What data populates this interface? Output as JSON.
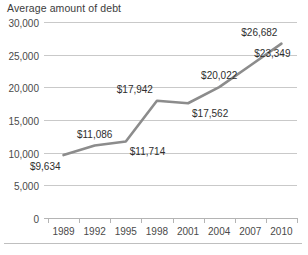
{
  "chart_data": {
    "type": "line",
    "title": "Average amount of debt",
    "xlabel": "",
    "ylabel": "",
    "categories": [
      "1989",
      "1992",
      "1995",
      "1998",
      "2001",
      "2004",
      "2007",
      "2010"
    ],
    "values": [
      9634,
      11086,
      11714,
      17942,
      17562,
      20022,
      23349,
      26682
    ],
    "point_labels": [
      "$9,634",
      "$11,086",
      "$11,714",
      "$17,942",
      "$17,562",
      "$20,022",
      "$23,349",
      "$26,682"
    ],
    "label_positions": [
      "below-left",
      "above",
      "below-right",
      "above-left",
      "below-right",
      "above",
      "above-right",
      "above-left"
    ],
    "ylim": [
      0,
      30000
    ],
    "ytick_values": [
      0,
      5000,
      10000,
      15000,
      20000,
      25000,
      30000
    ],
    "ytick_labels": [
      "0",
      "5,000",
      "10,000",
      "15,000",
      "20,000",
      "25,000",
      "30,000"
    ],
    "grid": true,
    "legend": false,
    "series_color": "#8c8c8c",
    "grid_color": "#c9c9c9",
    "axis_color": "#b4b4b4",
    "text_color": "#3c3c3c",
    "background": "#ffffff"
  }
}
